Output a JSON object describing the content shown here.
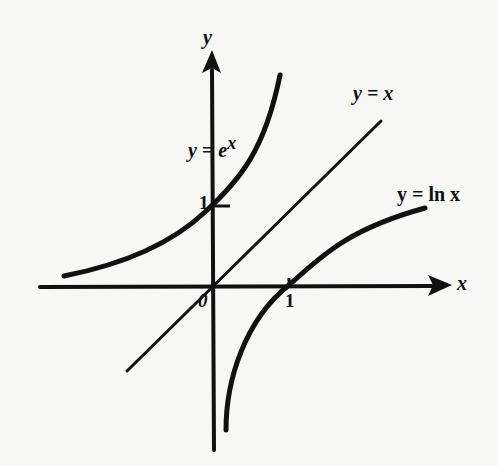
{
  "diagram": {
    "colors": {
      "ink": "#111111",
      "background": "#f7f7f5"
    },
    "axes": {
      "x_label": "x",
      "y_label": "y",
      "origin_label": "0",
      "x_tick_label": "1",
      "y_tick_label": "1"
    },
    "curves": [
      {
        "id": "exp",
        "label_y": "y",
        "label_eq": "=",
        "label_base": "e",
        "label_exp": "x"
      },
      {
        "id": "identity",
        "label": "y = x"
      },
      {
        "id": "log",
        "label": "y = ln x"
      }
    ]
  }
}
